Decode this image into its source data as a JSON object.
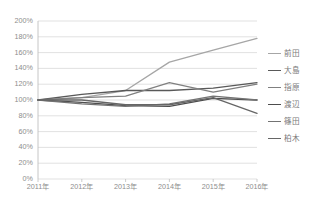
{
  "chart_data": {
    "type": "line",
    "title": "",
    "xlabel": "",
    "ylabel": "",
    "categories": [
      "2011年",
      "2012年",
      "2013年",
      "2014年",
      "2015年",
      "2016年"
    ],
    "ylim": [
      0,
      200
    ],
    "ytick_labels": [
      "200%",
      "180%",
      "160%",
      "140%",
      "120%",
      "100%",
      "80%",
      "60%",
      "40%",
      "20%",
      "0%"
    ],
    "ytick_values": [
      200,
      180,
      160,
      140,
      120,
      100,
      80,
      60,
      40,
      20,
      0
    ],
    "ytick_step": 20,
    "yunit": "%",
    "grid": true,
    "legend_position": "right",
    "series": [
      {
        "name": "前田",
        "color": "#a6a6a6",
        "values": [
          100,
          103,
          112,
          148,
          163,
          178
        ]
      },
      {
        "name": "大島",
        "color": "#595959",
        "values": [
          100,
          107,
          112,
          112,
          115,
          122
        ]
      },
      {
        "name": "指原",
        "color": "#808080",
        "values": [
          100,
          103,
          105,
          122,
          110,
          120
        ]
      },
      {
        "name": "渡辺",
        "color": "#4d4d4d",
        "values": [
          100,
          97,
          93,
          92,
          102,
          100
        ]
      },
      {
        "name": "篠田",
        "color": "#737373",
        "values": [
          100,
          95,
          92,
          95,
          105,
          100
        ]
      },
      {
        "name": "柏木",
        "color": "#666666",
        "values": [
          100,
          100,
          94,
          94,
          103,
          83
        ]
      }
    ]
  },
  "legend": {
    "items": [
      {
        "label": "前田"
      },
      {
        "label": "大島"
      },
      {
        "label": "指原"
      },
      {
        "label": "渡辺"
      },
      {
        "label": "篠田"
      },
      {
        "label": "柏木"
      }
    ]
  },
  "colors": {
    "axis_text": "#8d8d8d",
    "gridline": "#d9d9d9",
    "axis_line": "#bfbfbf",
    "background": "#ffffff"
  }
}
